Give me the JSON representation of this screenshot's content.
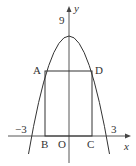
{
  "diagram": {
    "type": "parabola-with-inscribed-rectangle",
    "curve": "y = 9 - x^2",
    "axes": {
      "x_label": "x",
      "y_label": "y",
      "origin_label": "O"
    },
    "tick_labels": {
      "y_intercept": "9",
      "x_left": "−3",
      "x_right": "3"
    },
    "points": {
      "A": "A",
      "B": "B",
      "C": "C",
      "D": "D"
    },
    "colors": {
      "stroke": "#333333",
      "background": "#ffffff"
    }
  }
}
